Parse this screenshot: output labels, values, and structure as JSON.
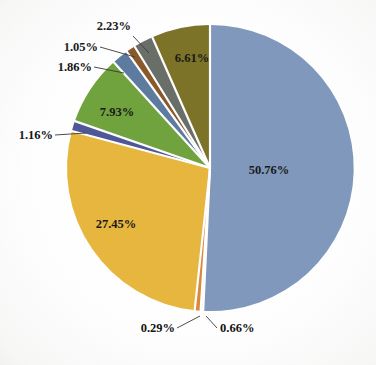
{
  "chart_data": {
    "type": "pie",
    "title": "",
    "subtitle": "",
    "xlabel": "",
    "ylabel": "",
    "legend": "none",
    "grid": false,
    "value_suffix": "%",
    "categories": [
      "Slice 1",
      "Slice 2",
      "Slice 3",
      "Slice 4",
      "Slice 5",
      "Slice 6",
      "Slice 7",
      "Slice 8",
      "Slice 9"
    ],
    "values": [
      50.76,
      27.45,
      1.16,
      7.93,
      1.86,
      1.05,
      2.23,
      6.61,
      0.29
    ],
    "labels": [
      "50.76%",
      "27.45%",
      "1.16%",
      "7.93%",
      "1.86%",
      "1.05%",
      "2.23%",
      "6.61%",
      "0.29%",
      "0.66%"
    ],
    "slices": [
      {
        "label": "50.76%",
        "value": 50.76,
        "color": "#8099bc",
        "label_placement": "inside"
      },
      {
        "label": "0.29%",
        "value": 0.29,
        "color": "#f0ece0",
        "label_placement": "callout"
      },
      {
        "label": "0.66%",
        "value": 0.66,
        "color": "#d98a3a",
        "label_placement": "callout"
      },
      {
        "label": "27.45%",
        "value": 27.45,
        "color": "#e8b73f",
        "label_placement": "inside"
      },
      {
        "label": "1.16%",
        "value": 1.16,
        "color": "#51589a",
        "label_placement": "callout"
      },
      {
        "label": "7.93%",
        "value": 7.93,
        "color": "#71a33f",
        "label_placement": "inside"
      },
      {
        "label": "1.86%",
        "value": 1.86,
        "color": "#5d7ca0",
        "label_placement": "callout"
      },
      {
        "label": "1.05%",
        "value": 1.05,
        "color": "#8a5a2b",
        "label_placement": "callout"
      },
      {
        "label": "2.23%",
        "value": 2.23,
        "color": "#6b6f6a",
        "label_placement": "callout"
      },
      {
        "label": "6.61%",
        "value": 6.61,
        "color": "#7d7329",
        "label_placement": "inside"
      }
    ],
    "colors": [
      "#8099bc",
      "#f0ece0",
      "#d98a3a",
      "#e8b73f",
      "#51589a",
      "#71a33f",
      "#5d7ca0",
      "#8a5a2b",
      "#6b6f6a",
      "#7d7329"
    ],
    "background": "#ffffff"
  },
  "labels_inside": {
    "big_blue": "50.76%",
    "gold": "27.45%",
    "green": "7.93%",
    "olive": "6.61%"
  },
  "labels_callout": {
    "top_gray": "2.23%",
    "brown": "1.05%",
    "bluegray": "1.86%",
    "purple": "1.16%",
    "bottom_left": "0.29%",
    "bottom_right": "0.66%"
  }
}
